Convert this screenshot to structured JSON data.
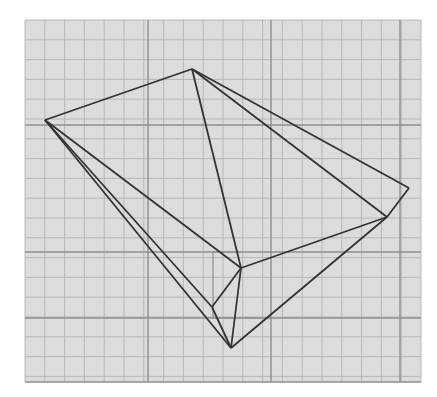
{
  "diagram": {
    "type": "polyhedron-net-sketch-on-graph-paper",
    "background": "#ffffff",
    "paper": {
      "x": 25,
      "y": 20,
      "width": 396,
      "height": 362,
      "fill": "#dcdcdc",
      "minor_spacing": 19.8,
      "minor_color": "#b3b3b3",
      "major_color": "#8f8f8f",
      "major_lines_x": [
        148,
        271,
        400
      ],
      "major_lines_y": [
        125,
        252,
        318,
        382
      ],
      "accent_segments": [
        {
          "x1": 213,
          "y1": 252,
          "x2": 241,
          "y2": 252
        },
        {
          "x1": 213,
          "y1": 252,
          "x2": 213,
          "y2": 318
        },
        {
          "x1": 213,
          "y1": 318,
          "x2": 271,
          "y2": 318
        }
      ]
    },
    "stroke_color": "#333333",
    "vertices": {
      "A": [
        45,
        120
      ],
      "B": [
        192,
        69
      ],
      "C": [
        409,
        188
      ],
      "D": [
        387,
        217
      ],
      "E": [
        241,
        268
      ],
      "F": [
        231,
        348
      ],
      "G": [
        212,
        307
      ]
    },
    "edges": [
      [
        "A",
        "B"
      ],
      [
        "B",
        "C"
      ],
      [
        "B",
        "D"
      ],
      [
        "C",
        "D"
      ],
      [
        "B",
        "E"
      ],
      [
        "A",
        "E"
      ],
      [
        "A",
        "G"
      ],
      [
        "A",
        "F"
      ],
      [
        "E",
        "D"
      ],
      [
        "E",
        "G"
      ],
      [
        "E",
        "F"
      ],
      [
        "G",
        "F"
      ],
      [
        "F",
        "D"
      ]
    ]
  }
}
